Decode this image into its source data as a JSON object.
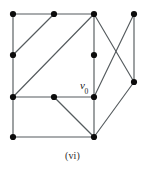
{
  "figure": {
    "caption": "(vi)",
    "background_color": "#ffffff",
    "edge_color": "#555b5e",
    "vertex_color": "#0c0c0c",
    "vertex_radius": 3.1,
    "edge_width": 1.15,
    "width": 145,
    "height": 172
  },
  "chart_data": {
    "type": "diagram",
    "diagram_kind": "undirected-graph",
    "title": "(vi)",
    "xlabel": "",
    "ylabel": "",
    "grid": false,
    "legend": false,
    "xlim": [
      0,
      145
    ],
    "ylim": [
      0,
      172
    ],
    "vertices": [
      {
        "id": "a",
        "x": 13,
        "y": 14,
        "label": ""
      },
      {
        "id": "b",
        "x": 54,
        "y": 14,
        "label": ""
      },
      {
        "id": "c",
        "x": 94,
        "y": 14,
        "label": ""
      },
      {
        "id": "d",
        "x": 134,
        "y": 14,
        "label": ""
      },
      {
        "id": "e",
        "x": 13,
        "y": 55,
        "label": ""
      },
      {
        "id": "f",
        "x": 94,
        "y": 55,
        "label": ""
      },
      {
        "id": "g",
        "x": 134,
        "y": 82,
        "label": ""
      },
      {
        "id": "h",
        "x": 13,
        "y": 97,
        "label": ""
      },
      {
        "id": "i",
        "x": 54,
        "y": 97,
        "label": ""
      },
      {
        "id": "v0",
        "x": 94,
        "y": 97,
        "label": "v0"
      },
      {
        "id": "j",
        "x": 13,
        "y": 137,
        "label": ""
      },
      {
        "id": "k",
        "x": 94,
        "y": 137,
        "label": ""
      }
    ],
    "edges": [
      {
        "from": "a",
        "to": "b"
      },
      {
        "from": "b",
        "to": "c"
      },
      {
        "from": "a",
        "to": "e"
      },
      {
        "from": "e",
        "to": "h"
      },
      {
        "from": "h",
        "to": "j"
      },
      {
        "from": "e",
        "to": "b"
      },
      {
        "from": "h",
        "to": "c"
      },
      {
        "from": "h",
        "to": "i"
      },
      {
        "from": "i",
        "to": "v0"
      },
      {
        "from": "c",
        "to": "f"
      },
      {
        "from": "f",
        "to": "v0"
      },
      {
        "from": "c",
        "to": "g"
      },
      {
        "from": "d",
        "to": "v0"
      },
      {
        "from": "d",
        "to": "g"
      },
      {
        "from": "j",
        "to": "k"
      },
      {
        "from": "i",
        "to": "k"
      },
      {
        "from": "v0",
        "to": "k"
      },
      {
        "from": "k",
        "to": "g"
      }
    ],
    "vertex_count": 12,
    "edge_count": 18,
    "labels": [
      {
        "text": "v0",
        "display": "v",
        "subscript": "0",
        "x": 80,
        "y": 80
      }
    ]
  }
}
